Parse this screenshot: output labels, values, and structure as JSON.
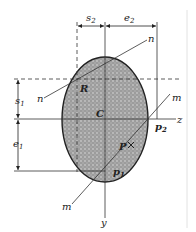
{
  "figure": {
    "type": "cross-section-diagram",
    "shape": "ellipse",
    "fill_color": "#a9a9a9",
    "stroke_color": "#222222",
    "labels": {
      "s2": "s",
      "s2_sub": "2",
      "e2": "e",
      "e2_sub": "2",
      "s1": "s",
      "s1_sub": "1",
      "e1": "e",
      "e1_sub": "1",
      "n_top": "n",
      "n_bottom": "n",
      "m_top": "m",
      "m_bottom": "m",
      "R": "R",
      "C": "C",
      "P": "P",
      "P1": "p",
      "P1_sub": "1",
      "P2": "p",
      "P2_sub": "2",
      "z": "z",
      "y": "y"
    }
  }
}
